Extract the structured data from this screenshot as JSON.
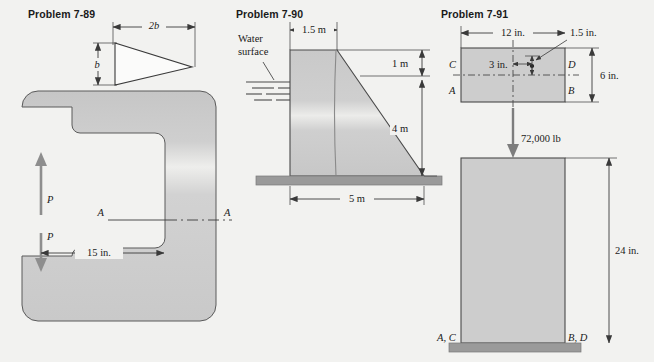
{
  "sheet": {
    "background_color": "#f2f2f0",
    "fill_color": "#cdcdcd",
    "ground_color": "#9a9a9a",
    "line_color": "#3a3a3a"
  },
  "problems": [
    {
      "id": "7-89",
      "label": "Problem 7-89",
      "triangle": {
        "dim_width": "2b",
        "dim_height": "b"
      },
      "clamp": {
        "force_top": "P",
        "force_bottom": "P",
        "span_dim": "15 in.",
        "section_left": "A",
        "section_right": "A"
      }
    },
    {
      "id": "7-90",
      "label": "Problem 7-90",
      "annotations": {
        "water_line1": "Water",
        "water_line2": "surface",
        "top_width": "1.5 m",
        "upper_height": "1 m",
        "lower_height": "4 m",
        "base_width": "5 m"
      }
    },
    {
      "id": "7-91",
      "label": "Problem 7-91",
      "top_view": {
        "width_dim": "12 in.",
        "offset_dim": "3 in.",
        "eccentric_dim": "1.5 in.",
        "depth_dim": "6 in.",
        "corner_C": "C",
        "corner_D": "D",
        "corner_A": "A",
        "corner_B": "B"
      },
      "elevation": {
        "load": "72,000 lb",
        "height_dim": "24 in.",
        "base_left": "A, C",
        "base_right": "B, D"
      }
    }
  ]
}
